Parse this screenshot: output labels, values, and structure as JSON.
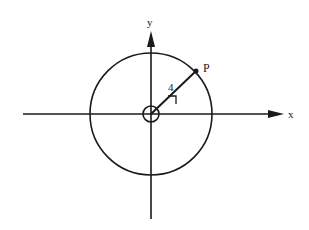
{
  "diagram": {
    "type": "polar-coordinate-figure",
    "axes": {
      "x_label": "x",
      "y_label": "y"
    },
    "circle": {
      "center": [
        151,
        114
      ],
      "radius": 61
    },
    "point": {
      "label": "P"
    },
    "radius_segment": {
      "label": "4"
    },
    "angle_marker": "small-circle-at-origin",
    "colors": {
      "ink": "#1a1a1a",
      "background": "#ffffff"
    }
  }
}
